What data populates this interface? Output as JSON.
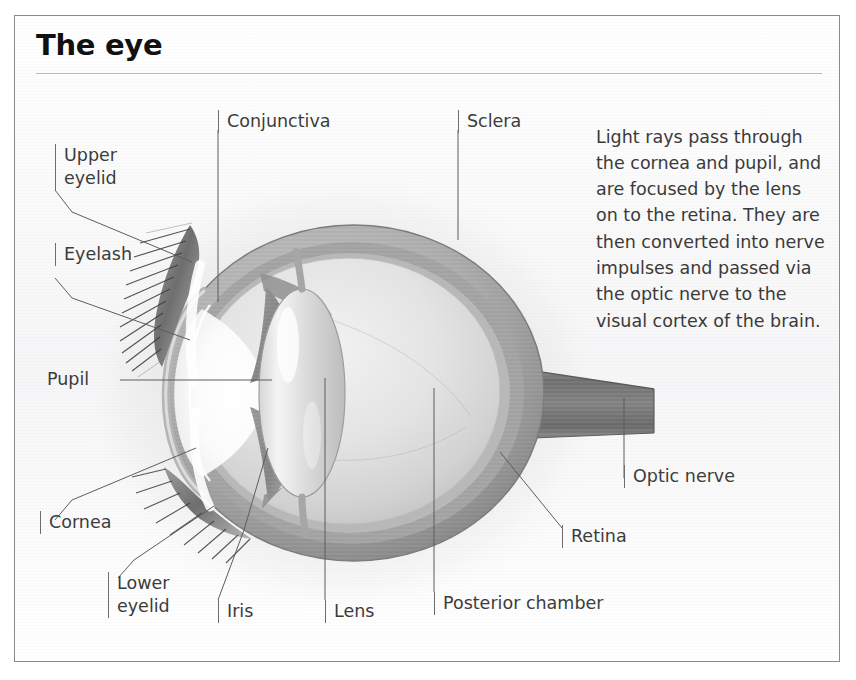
{
  "page": {
    "title": "The eye",
    "border_color": "#8a8a8a",
    "rule_color": "#b9b9b9",
    "text_color": "#3c3c3c",
    "title_color": "#111111",
    "background": "#ffffff"
  },
  "intro": {
    "text": "Light rays pass through the cornea and pupil, and are focused by the lens on to the retina. They are then converted into nerve impulses and passed via the optic nerve to the visual cortex of the brain."
  },
  "diagram": {
    "labels": [
      {
        "id": "upper-eyelid",
        "text": "Upper\neyelid",
        "style": "tick"
      },
      {
        "id": "eyelash",
        "text": "Eyelash",
        "style": "tick"
      },
      {
        "id": "pupil",
        "text": "Pupil",
        "style": "plain"
      },
      {
        "id": "cornea",
        "text": "Cornea",
        "style": "tick"
      },
      {
        "id": "lower-eyelid",
        "text": "Lower\neyelid",
        "style": "tick"
      },
      {
        "id": "iris",
        "text": "Iris",
        "style": "tick"
      },
      {
        "id": "lens",
        "text": "Lens",
        "style": "tick"
      },
      {
        "id": "posterior-chamber",
        "text": "Posterior chamber",
        "style": "tick"
      },
      {
        "id": "conjunctiva",
        "text": "Conjunctiva",
        "style": "tick"
      },
      {
        "id": "sclera",
        "text": "Sclera",
        "style": "tick"
      },
      {
        "id": "optic-nerve",
        "text": "Optic nerve",
        "style": "tick"
      },
      {
        "id": "retina",
        "text": "Retina",
        "style": "tick"
      }
    ]
  }
}
